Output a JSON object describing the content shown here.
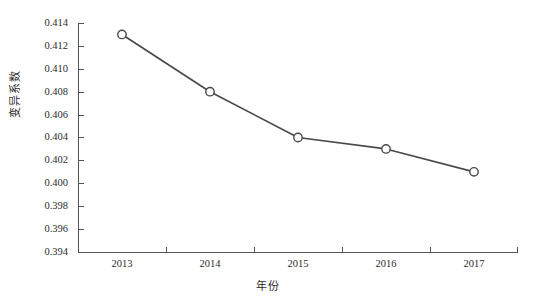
{
  "chart_data": {
    "type": "line",
    "title": "",
    "xlabel": "年份",
    "ylabel": "变异系数",
    "categories": [
      "2013",
      "2014",
      "2015",
      "2016",
      "2017"
    ],
    "values": [
      0.413,
      0.408,
      0.404,
      0.403,
      0.401
    ],
    "series": [
      {
        "name": "变异系数",
        "values": [
          0.413,
          0.408,
          0.404,
          0.403,
          0.401
        ]
      }
    ],
    "ylim": [
      0.394,
      0.414
    ],
    "ytick_step": 0.002,
    "ytick_labels": [
      "0.414",
      "0.412",
      "0.410",
      "0.408",
      "0.406",
      "0.404",
      "0.402",
      "0.400",
      "0.398",
      "0.396",
      "0.394"
    ],
    "xtick_labels": [
      "2013",
      "2014",
      "2015",
      "2016",
      "2017"
    ],
    "grid": false,
    "legend": false,
    "legend_position": "none",
    "line_color": "#4a4a4a",
    "marker_shape": "circle-open",
    "marker_fill": "#ffffff",
    "marker_edge_color": "#4a4a4a",
    "axis_color": "#555555",
    "background_color": "#ffffff"
  },
  "axes": {
    "y_title": "变异系数",
    "x_title": "年份"
  }
}
